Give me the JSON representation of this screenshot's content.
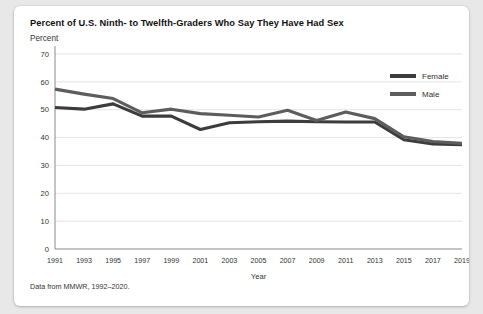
{
  "card": {
    "footnote": "Data from MMWR, 1992–2020."
  },
  "chart_data": {
    "type": "line",
    "title": "Percent of U.S. Ninth- to Twelfth-Graders Who Say They Have Had Sex",
    "ylabel": "Percent",
    "xlabel": "Year",
    "ylim": [
      0,
      70
    ],
    "yticks": [
      0,
      10,
      20,
      30,
      40,
      50,
      60,
      70
    ],
    "grid": true,
    "legend_position": "top-right",
    "categories": [
      1991,
      1993,
      1995,
      1997,
      1999,
      2001,
      2003,
      2005,
      2007,
      2009,
      2011,
      2013,
      2015,
      2017,
      2019
    ],
    "xtick_labels": [
      "1991",
      "1993",
      "1995",
      "1997",
      "1999",
      "2001",
      "2003",
      "2005",
      "2007",
      "2009",
      "2011",
      "2013",
      "2015",
      "2017",
      "2019"
    ],
    "series": [
      {
        "name": "Female",
        "color": "#3c3c3c",
        "values": [
          50.8,
          50.2,
          52.1,
          47.7,
          47.7,
          42.9,
          45.3,
          45.7,
          45.9,
          45.7,
          45.6,
          45.6,
          39.2,
          37.7,
          37.4
        ]
      },
      {
        "name": "Male",
        "color": "#5d5d5d",
        "values": [
          57.4,
          55.6,
          54.0,
          48.9,
          50.2,
          48.6,
          48.0,
          47.4,
          49.8,
          46.1,
          49.2,
          46.8,
          40.3,
          38.6,
          37.9
        ]
      }
    ]
  }
}
